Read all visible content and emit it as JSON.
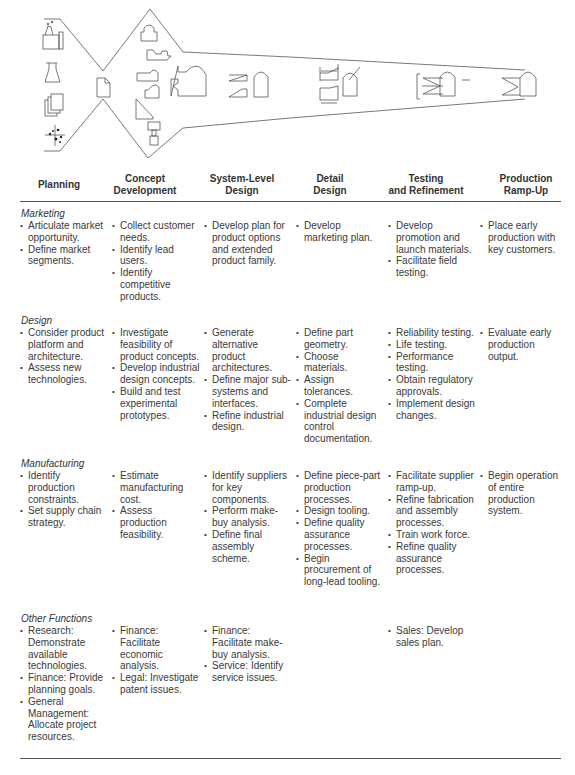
{
  "diagram": {
    "icons_planning": [
      "factory-icon",
      "flask-icon",
      "documents-stack-icon",
      "scatter-plot-icon"
    ],
    "center_icon": "document-icon",
    "stages_shapes": [
      "concept-parts-icon",
      "assembled-part-icon",
      "system-split-icon",
      "detail-tolerance-icon",
      "testing-fixture-icon",
      "production-part-icon"
    ]
  },
  "columns": [
    {
      "id": "planning",
      "label": "Planning"
    },
    {
      "id": "concept",
      "label": "Concept Development"
    },
    {
      "id": "system",
      "label": "System-Level Design"
    },
    {
      "id": "detail",
      "label": "Detail Design"
    },
    {
      "id": "testing",
      "label": "Testing and Refinement"
    },
    {
      "id": "rampup",
      "label": "Production Ramp-Up"
    }
  ],
  "headers": {
    "planning": [
      "Planning"
    ],
    "concept": [
      "Concept",
      "Development"
    ],
    "system": [
      "System-Level",
      "Design"
    ],
    "detail": [
      "Detail",
      "Design"
    ],
    "testing": [
      "Testing",
      "and Refinement"
    ],
    "rampup": [
      "Production",
      "Ramp-Up"
    ]
  },
  "sections": [
    {
      "title": "Marketing",
      "cells": [
        [
          "Articulate market opportunity.",
          "Define market segments."
        ],
        [
          "Collect customer needs.",
          "Identify lead users.",
          "Identify competitive products."
        ],
        [
          "Develop plan for product options and extended product family."
        ],
        [
          "Develop marketing plan."
        ],
        [
          "Develop promotion and launch materials.",
          "Facilitate field testing."
        ],
        [
          "Place early production with key customers."
        ]
      ]
    },
    {
      "title": "Design",
      "cells": [
        [
          "Consider product platform and architecture.",
          "Assess new technologies."
        ],
        [
          "Investigate feasibility of product concepts.",
          "Develop industrial design concepts.",
          "Build and test experimental prototypes."
        ],
        [
          "Generate alternative product architectures.",
          "Define major sub-systems and interfaces.",
          "Refine industrial design."
        ],
        [
          "Define part geometry.",
          "Choose materials.",
          "Assign tolerances.",
          "Complete industrial design control documentation."
        ],
        [
          "Reliability testing.",
          "Life testing.",
          "Performance testing.",
          "Obtain regulatory approvals.",
          "Implement design changes."
        ],
        [
          "Evaluate early production output."
        ]
      ]
    },
    {
      "title": "Manufacturing",
      "cells": [
        [
          "Identify production constraints.",
          "Set supply chain strategy."
        ],
        [
          "Estimate manufacturing cost.",
          "Assess production feasibility."
        ],
        [
          "Identify suppliers for key components.",
          "Perform make-buy analysis.",
          "Define final assembly scheme."
        ],
        [
          "Define piece-part production processes.",
          "Design tooling.",
          "Define quality assurance processes.",
          "Begin procurement of long-lead tooling."
        ],
        [
          "Facilitate supplier ramp-up.",
          "Refine fabrication and assembly processes.",
          "Train work force.",
          "Refine quality assurance processes."
        ],
        [
          "Begin operation of entire production system."
        ]
      ]
    },
    {
      "title": "Other Functions",
      "cells": [
        [
          "Research: Demonstrate available technologies.",
          "Finance: Provide planning goals.",
          "General Management: Allocate project resources."
        ],
        [
          "Finance: Facilitate economic analysis.",
          "Legal: Investigate patent issues."
        ],
        [
          "Finance: Facilitate make-buy analysis.",
          "Service: Identify service issues."
        ],
        [],
        [
          "Sales: Develop sales plan."
        ],
        []
      ]
    }
  ]
}
